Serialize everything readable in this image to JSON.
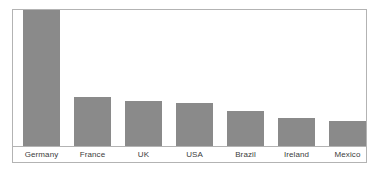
{
  "chart_data": {
    "type": "bar",
    "title": "",
    "subtitle": "",
    "xlabel": "",
    "ylabel": "",
    "categories": [
      "Germany",
      "France",
      "UK",
      "USA",
      "Brazil",
      "Ireland",
      "Mexico"
    ],
    "values": [
      100,
      36,
      33,
      32,
      26,
      21,
      19
    ],
    "ylim": [
      0,
      100
    ],
    "grid": false,
    "legend": false,
    "legend_position": "none",
    "series": [
      {
        "name": "",
        "values": [
          100,
          36,
          33,
          32,
          26,
          21,
          19
        ]
      }
    ],
    "annotations": [],
    "axis_tick_labels": {
      "x": [
        "Germany",
        "France",
        "UK",
        "USA",
        "Brazil",
        "Ireland",
        "Mexico"
      ],
      "y": []
    }
  },
  "style": {
    "bar_color": "#8a8a8a",
    "frame_color": "#b3b3b3",
    "label_color": "#3c3c3c",
    "background": "#ffffff"
  },
  "geometry": {
    "bar_width_px": 37,
    "bar_pitch_px": 51,
    "first_bar_left_px": 10,
    "plot_height_px": 138
  }
}
